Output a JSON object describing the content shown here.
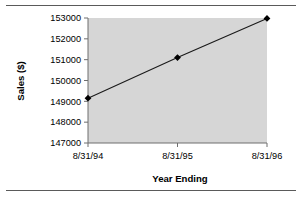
{
  "figure": {
    "top_rule": "horizontal-rule",
    "bottom_rule": "horizontal-rule",
    "plot_background": "#d6d6d6",
    "axis_color": "#808080",
    "series_color": "#000000"
  },
  "chart_data": {
    "type": "line",
    "title": "",
    "xlabel": "Year Ending",
    "ylabel": "Sales ($)",
    "categories": [
      "8/31/94",
      "8/31/95",
      "8/31/96"
    ],
    "values": [
      149150,
      151100,
      152980
    ],
    "series": [
      {
        "name": "Sales ($)",
        "values": [
          149150,
          151100,
          152980
        ]
      }
    ],
    "ylim": [
      147000,
      153000
    ],
    "yticks": [
      147000,
      148000,
      149000,
      150000,
      151000,
      152000,
      153000
    ],
    "ytick_labels": [
      "147000",
      "148000",
      "149000",
      "150000",
      "151000",
      "152000",
      "153000"
    ],
    "xtick_labels": [
      "8/31/94",
      "8/31/95",
      "8/31/96"
    ],
    "grid": false,
    "legend": false,
    "marker": "diamond"
  }
}
